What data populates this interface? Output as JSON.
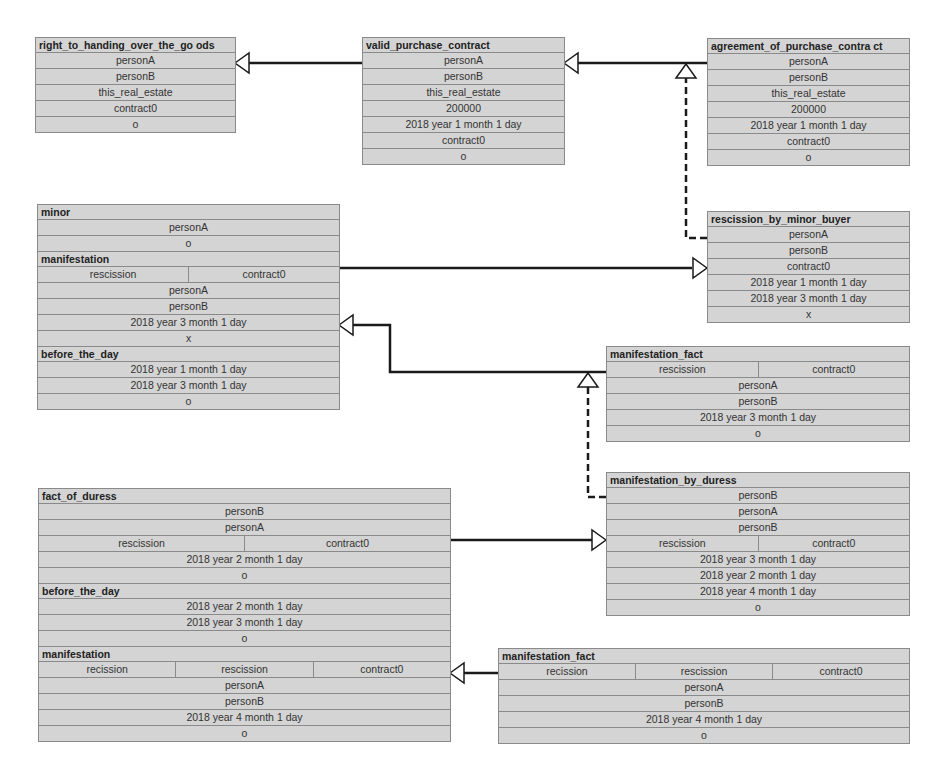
{
  "boxes": {
    "right_to_handing": {
      "sections": [
        {
          "title": "right_to_handing_over_the_go ods",
          "rows": [
            [
              "personA"
            ],
            [
              "personB"
            ],
            [
              "this_real_estate"
            ],
            [
              "contract0"
            ],
            [
              "o"
            ]
          ]
        }
      ]
    },
    "valid_purchase": {
      "sections": [
        {
          "title": "valid_purchase_contract",
          "rows": [
            [
              "personA"
            ],
            [
              "personB"
            ],
            [
              "this_real_estate"
            ],
            [
              "200000"
            ],
            [
              "2018 year 1 month 1 day"
            ],
            [
              "contract0"
            ],
            [
              "o"
            ]
          ]
        }
      ]
    },
    "agreement": {
      "sections": [
        {
          "title": "agreement_of_purchase_contra ct",
          "rows": [
            [
              "personA"
            ],
            [
              "personB"
            ],
            [
              "this_real_estate"
            ],
            [
              "200000"
            ],
            [
              "2018 year 1 month 1 day"
            ],
            [
              "contract0"
            ],
            [
              "o"
            ]
          ]
        }
      ]
    },
    "minor": {
      "sections": [
        {
          "title": "minor",
          "rows": [
            [
              "personA"
            ],
            [
              "o"
            ]
          ]
        },
        {
          "title": "manifestation",
          "rows": [
            [
              "rescission",
              "contract0"
            ],
            [
              "personA"
            ],
            [
              "personB"
            ],
            [
              "2018 year 3 month 1 day"
            ],
            [
              "x"
            ]
          ]
        },
        {
          "title": "before_the_day",
          "rows": [
            [
              "2018 year 1 month 1 day"
            ],
            [
              "2018 year 3 month 1 day"
            ],
            [
              "o"
            ]
          ]
        }
      ]
    },
    "rescission_by_minor": {
      "sections": [
        {
          "title": "rescission_by_minor_buyer",
          "rows": [
            [
              "personA"
            ],
            [
              "personB"
            ],
            [
              "contract0"
            ],
            [
              "2018 year 1 month 1 day"
            ],
            [
              "2018 year 3 month 1 day"
            ],
            [
              "x"
            ]
          ]
        }
      ]
    },
    "manifestation_fact_mid": {
      "sections": [
        {
          "title": "manifestation_fact",
          "rows": [
            [
              "rescission",
              "contract0"
            ],
            [
              "personA"
            ],
            [
              "personB"
            ],
            [
              "2018 year 3 month 1 day"
            ],
            [
              "o"
            ]
          ]
        }
      ]
    },
    "fact_of_duress": {
      "sections": [
        {
          "title": "fact_of_duress",
          "rows": [
            [
              "personB"
            ],
            [
              "personA"
            ],
            [
              "rescission",
              "contract0"
            ],
            [
              "2018 year 2 month 1 day"
            ],
            [
              "o"
            ]
          ]
        },
        {
          "title": "before_the_day",
          "rows": [
            [
              "2018 year 2 month 1 day"
            ],
            [
              "2018 year 3 month 1 day"
            ],
            [
              "o"
            ]
          ]
        },
        {
          "title": "manifestation",
          "rows": [
            [
              "recission",
              "rescission",
              "contract0"
            ],
            [
              "personA"
            ],
            [
              "personB"
            ],
            [
              "2018 year 4 month 1 day"
            ],
            [
              "o"
            ]
          ]
        }
      ]
    },
    "manifestation_by_duress": {
      "sections": [
        {
          "title": "manifestation_by_duress",
          "rows": [
            [
              "personB"
            ],
            [
              "personA"
            ],
            [
              "personB"
            ],
            [
              "rescission",
              "contract0"
            ],
            [
              "2018 year 3 month 1 day"
            ],
            [
              "2018 year 2 month 1 day"
            ],
            [
              "2018 year 4 month 1 day"
            ],
            [
              "o"
            ]
          ]
        }
      ]
    },
    "manifestation_fact_bottom": {
      "sections": [
        {
          "title": "manifestation_fact",
          "rows": [
            [
              "recission",
              "rescission",
              "contract0"
            ],
            [
              "personA"
            ],
            [
              "personB"
            ],
            [
              "2018 year 4 month 1 day"
            ],
            [
              "o"
            ]
          ]
        }
      ]
    }
  },
  "colors": {
    "box_fill": "#d4d4d4",
    "box_border": "#8a8a8a",
    "line": "#1a1a1a"
  }
}
